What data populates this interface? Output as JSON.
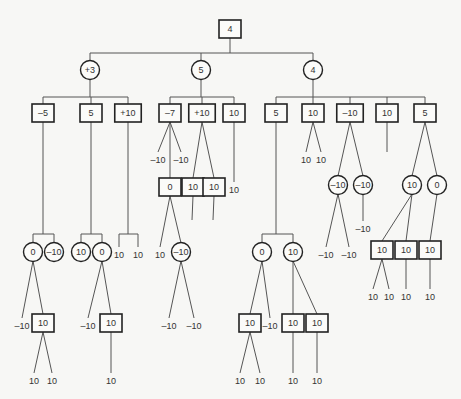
{
  "diagram": {
    "type": "game-tree",
    "legend": {
      "square": "max-node",
      "circle": "min-node",
      "plain": "leaf-value"
    },
    "nodes": [
      {
        "id": "root",
        "shape": "square",
        "label": "4",
        "x": 230,
        "y": 29
      },
      {
        "id": "a",
        "shape": "circle",
        "label": "+3",
        "x": 90,
        "y": 70,
        "parent": "root"
      },
      {
        "id": "b",
        "shape": "circle",
        "label": "5",
        "x": 201,
        "y": 70,
        "parent": "root"
      },
      {
        "id": "c",
        "shape": "circle",
        "label": "4",
        "x": 313,
        "y": 70,
        "parent": "root"
      },
      {
        "id": "a1",
        "shape": "square",
        "label": "-5",
        "x": 43,
        "y": 113,
        "parent": "a"
      },
      {
        "id": "a2",
        "shape": "square",
        "label": "5",
        "x": 91,
        "y": 113,
        "parent": "a"
      },
      {
        "id": "a3",
        "shape": "square",
        "label": "+10",
        "x": 128,
        "y": 113,
        "parent": "a"
      },
      {
        "id": "b1",
        "shape": "square",
        "label": "-7",
        "x": 170,
        "y": 113,
        "parent": "b"
      },
      {
        "id": "b2",
        "shape": "square",
        "label": "+10",
        "x": 202,
        "y": 113,
        "parent": "b"
      },
      {
        "id": "b3",
        "shape": "square",
        "label": "10",
        "x": 234,
        "y": 113,
        "parent": "b"
      },
      {
        "id": "c1",
        "shape": "square",
        "label": "5",
        "x": 276,
        "y": 113,
        "parent": "c"
      },
      {
        "id": "c2",
        "shape": "square",
        "label": "10",
        "x": 313,
        "y": 113,
        "parent": "c"
      },
      {
        "id": "c3",
        "shape": "square",
        "label": "-10",
        "x": 350,
        "y": 113,
        "parent": "c"
      },
      {
        "id": "c4",
        "shape": "square",
        "label": "10",
        "x": 387,
        "y": 113,
        "parent": "c"
      },
      {
        "id": "c5",
        "shape": "square",
        "label": "5",
        "x": 425,
        "y": 113,
        "parent": "c"
      },
      {
        "id": "a1x",
        "shape": "circle",
        "label": "0",
        "x": 33,
        "y": 252,
        "parent": "a1",
        "bracket": true
      },
      {
        "id": "a1y",
        "shape": "circle",
        "label": "-10",
        "x": 54,
        "y": 252,
        "parent": "a1",
        "bracket": true
      },
      {
        "id": "a2x",
        "shape": "circle",
        "label": "10",
        "x": 81,
        "y": 252,
        "parent": "a2",
        "bracket": true
      },
      {
        "id": "a2y",
        "shape": "circle",
        "label": "0",
        "x": 102,
        "y": 252,
        "parent": "a2",
        "bracket": true
      },
      {
        "id": "a3x",
        "shape": "leaf",
        "label": "10",
        "x": 119,
        "y": 252,
        "parent": "a3",
        "bracket": true
      },
      {
        "id": "a3y",
        "shape": "leaf",
        "label": "10",
        "x": 138,
        "y": 252,
        "parent": "a3",
        "bracket": true
      },
      {
        "id": "a1x1",
        "shape": "leaf",
        "label": "-10",
        "x": 22,
        "y": 323,
        "parent": "a1x"
      },
      {
        "id": "a1x2",
        "shape": "square",
        "label": "10",
        "x": 43,
        "y": 323,
        "parent": "a1x"
      },
      {
        "id": "a1x2a",
        "shape": "leaf",
        "label": "10",
        "x": 34,
        "y": 378,
        "parent": "a1x2"
      },
      {
        "id": "a1x2b",
        "shape": "leaf",
        "label": "10",
        "x": 52,
        "y": 378,
        "parent": "a1x2"
      },
      {
        "id": "a2y1",
        "shape": "leaf",
        "label": "-10",
        "x": 88,
        "y": 323,
        "parent": "a2y"
      },
      {
        "id": "a2y2",
        "shape": "square",
        "label": "10",
        "x": 111,
        "y": 323,
        "parent": "a2y"
      },
      {
        "id": "a2y2a",
        "shape": "leaf",
        "label": "10",
        "x": 111,
        "y": 378,
        "parent": "a2y2"
      },
      {
        "id": "b1a",
        "shape": "leaf",
        "label": "-10",
        "x": 158,
        "y": 157,
        "parent": "b1"
      },
      {
        "id": "b1b",
        "shape": "leaf",
        "label": "-10",
        "x": 181,
        "y": 157,
        "parent": "b1"
      },
      {
        "id": "b1c",
        "shape": "square",
        "label": "0",
        "x": 170,
        "y": 187,
        "parent": "b1"
      },
      {
        "id": "b1c1",
        "shape": "leaf",
        "label": "10",
        "x": 160,
        "y": 252,
        "parent": "b1c"
      },
      {
        "id": "b1c2",
        "shape": "circle",
        "label": "-10",
        "x": 181,
        "y": 252,
        "parent": "b1c"
      },
      {
        "id": "b1c2a",
        "shape": "leaf",
        "label": "-10",
        "x": 169,
        "y": 323,
        "parent": "b1c2"
      },
      {
        "id": "b1c2b",
        "shape": "leaf",
        "label": "-10",
        "x": 194,
        "y": 323,
        "parent": "b1c2"
      },
      {
        "id": "b2a",
        "shape": "square",
        "label": "10",
        "x": 193,
        "y": 187,
        "parent": "b2"
      },
      {
        "id": "b2b",
        "shape": "square",
        "label": "10",
        "x": 214,
        "y": 187,
        "parent": "b2"
      },
      {
        "id": "b2a1",
        "shape": "stub",
        "label": "",
        "x": 192,
        "y": 220,
        "parent": "b2a"
      },
      {
        "id": "b2b1",
        "shape": "stub",
        "label": "",
        "x": 213,
        "y": 220,
        "parent": "b2b"
      },
      {
        "id": "b3a",
        "shape": "leaf",
        "label": "10",
        "x": 234,
        "y": 187,
        "parent": "b3"
      },
      {
        "id": "c1x",
        "shape": "circle",
        "label": "0",
        "x": 262,
        "y": 252,
        "parent": "c1",
        "bracket": true
      },
      {
        "id": "c1y",
        "shape": "circle",
        "label": "10",
        "x": 293,
        "y": 252,
        "parent": "c1",
        "bracket": true
      },
      {
        "id": "c1x1",
        "shape": "square",
        "label": "10",
        "x": 250,
        "y": 323,
        "parent": "c1x"
      },
      {
        "id": "c1x2",
        "shape": "leaf",
        "label": "-10",
        "x": 270,
        "y": 323,
        "parent": "c1x"
      },
      {
        "id": "c1x1a",
        "shape": "leaf",
        "label": "10",
        "x": 240,
        "y": 378,
        "parent": "c1x1"
      },
      {
        "id": "c1x1b",
        "shape": "leaf",
        "label": "10",
        "x": 260,
        "y": 378,
        "parent": "c1x1"
      },
      {
        "id": "c1y1",
        "shape": "square",
        "label": "10",
        "x": 293,
        "y": 323,
        "parent": "c1y"
      },
      {
        "id": "c1y2",
        "shape": "square",
        "label": "10",
        "x": 317,
        "y": 323,
        "parent": "c1y"
      },
      {
        "id": "c1y1a",
        "shape": "leaf",
        "label": "10",
        "x": 293,
        "y": 378,
        "parent": "c1y1"
      },
      {
        "id": "c1y2a",
        "shape": "leaf",
        "label": "10",
        "x": 317,
        "y": 378,
        "parent": "c1y2"
      },
      {
        "id": "c2a",
        "shape": "leaf",
        "label": "10",
        "x": 306,
        "y": 157,
        "parent": "c2"
      },
      {
        "id": "c2b",
        "shape": "leaf",
        "label": "10",
        "x": 321,
        "y": 157,
        "parent": "c2"
      },
      {
        "id": "c3a",
        "shape": "circle",
        "label": "-10",
        "x": 338,
        "y": 185,
        "parent": "c3"
      },
      {
        "id": "c3b",
        "shape": "circle",
        "label": "-10",
        "x": 363,
        "y": 185,
        "parent": "c3"
      },
      {
        "id": "c3a1",
        "shape": "leaf",
        "label": "-10",
        "x": 326,
        "y": 252,
        "parent": "c3a"
      },
      {
        "id": "c3a2",
        "shape": "leaf",
        "label": "-10",
        "x": 349,
        "y": 252,
        "parent": "c3a"
      },
      {
        "id": "c3b1",
        "shape": "leaf",
        "label": "-10",
        "x": 363,
        "y": 226,
        "parent": "c3b"
      },
      {
        "id": "c4a",
        "shape": "stub",
        "label": "",
        "x": 387,
        "y": 152,
        "parent": "c4"
      },
      {
        "id": "c5a",
        "shape": "circle",
        "label": "10",
        "x": 412,
        "y": 185,
        "parent": "c5"
      },
      {
        "id": "c5b",
        "shape": "circle",
        "label": "0",
        "x": 437,
        "y": 185,
        "parent": "c5"
      },
      {
        "id": "c5a1",
        "shape": "square",
        "label": "10",
        "x": 382,
        "y": 250,
        "parent": "c5a"
      },
      {
        "id": "c5a2",
        "shape": "square",
        "label": "10",
        "x": 406,
        "y": 250,
        "parent": "c5a"
      },
      {
        "id": "c5b1",
        "shape": "square",
        "label": "10",
        "x": 430,
        "y": 250,
        "parent": "c5b"
      },
      {
        "id": "c5a1a",
        "shape": "leaf",
        "label": "10",
        "x": 373,
        "y": 294,
        "parent": "c5a1"
      },
      {
        "id": "c5a1b",
        "shape": "leaf",
        "label": "10",
        "x": 389,
        "y": 294,
        "parent": "c5a1"
      },
      {
        "id": "c5a2a",
        "shape": "leaf",
        "label": "10",
        "x": 406,
        "y": 294,
        "parent": "c5a2"
      },
      {
        "id": "c5b1a",
        "shape": "leaf",
        "label": "10",
        "x": 430,
        "y": 294,
        "parent": "c5b1"
      }
    ]
  }
}
